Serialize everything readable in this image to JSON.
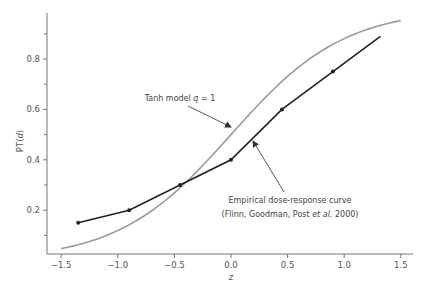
{
  "chart_data": {
    "type": "line",
    "title": "",
    "xlabel": "z",
    "ylabel": "PT(d)",
    "xlim": [
      -1.5,
      1.55
    ],
    "ylim": [
      0.03,
      0.98
    ],
    "grid": false,
    "x_ticks": [
      -1.5,
      -1.0,
      -0.5,
      0.0,
      0.5,
      1.0,
      1.5
    ],
    "x_tick_labels": [
      "−1.5",
      "−1.0",
      "−0.5",
      "0.0",
      "0.5",
      "1.0",
      "1.5"
    ],
    "y_ticks_major": [
      0.2,
      0.4,
      0.6,
      0.8
    ],
    "y_tick_labels": [
      "0.2",
      "0.4",
      "0.6",
      "0.8"
    ],
    "y_ticks_minor": [
      0.1,
      0.3,
      0.5,
      0.7,
      0.9
    ],
    "series": [
      {
        "name": "Tanh model q = 1",
        "style": "smooth curve",
        "color": "#9a9a9a",
        "function": "(1 + tanh(z)) / 2",
        "x_range": [
          -1.5,
          1.5
        ]
      },
      {
        "name": "Empirical dose-response curve",
        "style": "line with markers",
        "color": "#222222",
        "x": [
          -1.35,
          -0.9,
          -0.45,
          0.0,
          0.45,
          0.9,
          1.32
        ],
        "y": [
          0.15,
          0.2,
          0.3,
          0.4,
          0.6,
          0.75,
          0.89
        ],
        "markers": [
          true,
          true,
          true,
          true,
          true,
          true,
          false
        ]
      }
    ],
    "annotations": [
      {
        "text": "Tanh model q = 1",
        "target_series": "Tanh model q = 1"
      },
      {
        "text_lines": [
          "Empirical dose-response curve",
          "(Flinn, Goodman, Post et al. 2000)"
        ],
        "target_series": "Empirical dose-response curve"
      }
    ]
  },
  "labels": {
    "xlabel": "z",
    "ylabel_main": "PT(",
    "ylabel_var": "d",
    "ylabel_close": ")",
    "tanh_annot_prefix": "Tanh model ",
    "tanh_annot_var": "q",
    "tanh_annot_suffix": " = 1",
    "emp_line1": "Empirical dose-response curve",
    "emp_line2_prefix": "(Flinn, Goodman, Post ",
    "emp_line2_etal": "et al.",
    "emp_line2_suffix": " 2000)"
  }
}
